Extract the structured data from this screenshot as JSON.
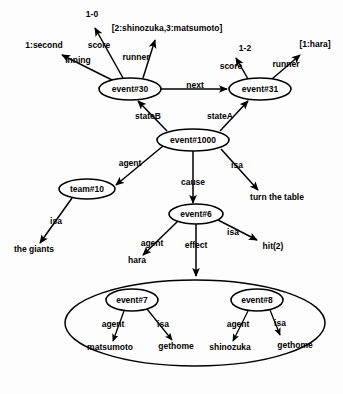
{
  "diagram": {
    "background_color": "#fdfdfd",
    "line_color": "#000000",
    "nodes": [
      {
        "id": "event30",
        "label": "event#30",
        "cx": 130,
        "cy": 89,
        "rx": 31,
        "ry": 11
      },
      {
        "id": "event31",
        "label": "event#31",
        "cx": 260,
        "cy": 89,
        "rx": 31,
        "ry": 11
      },
      {
        "id": "event1000",
        "label": "event#1000",
        "cx": 193,
        "cy": 140,
        "rx": 36,
        "ry": 11
      },
      {
        "id": "team10",
        "label": "team#10",
        "cx": 87,
        "cy": 189,
        "rx": 28,
        "ry": 10
      },
      {
        "id": "event6",
        "label": "event#6",
        "cx": 196,
        "cy": 214,
        "rx": 27,
        "ry": 10
      },
      {
        "id": "event7",
        "label": "event#7",
        "cx": 132,
        "cy": 300,
        "rx": 26,
        "ry": 11
      },
      {
        "id": "event8",
        "label": "event#8",
        "cx": 257,
        "cy": 300,
        "rx": 26,
        "ry": 11
      }
    ],
    "group_ellipse": {
      "cx": 195,
      "cy": 323,
      "rx": 130,
      "ry": 43
    },
    "values": [
      {
        "id": "v-1-second",
        "text": "1:second",
        "x": 44,
        "y": 48
      },
      {
        "id": "v-1-0",
        "text": "1-0",
        "x": 92,
        "y": 17
      },
      {
        "id": "v-runner-30",
        "text": "[2:shinozuka,3:matsumoto]",
        "x": 167,
        "y": 31
      },
      {
        "id": "v-1-2",
        "text": "1-2",
        "x": 245,
        "y": 51
      },
      {
        "id": "v-1-hara",
        "text": "[1:hara]",
        "x": 315,
        "y": 47
      },
      {
        "id": "v-turn-table",
        "text": "turn the table",
        "x": 277,
        "y": 200
      },
      {
        "id": "v-the-giants",
        "text": "the giants",
        "x": 34,
        "y": 252
      },
      {
        "id": "v-hara",
        "text": "hara",
        "x": 137,
        "y": 263
      },
      {
        "id": "v-hit2",
        "text": "hit(2)",
        "x": 273,
        "y": 249
      },
      {
        "id": "v-matsumoto",
        "text": "matsumoto",
        "x": 110,
        "y": 350
      },
      {
        "id": "v-gethome-1",
        "text": "gethome",
        "x": 176,
        "y": 349
      },
      {
        "id": "v-shinozuka",
        "text": "shinozuka",
        "x": 230,
        "y": 350
      },
      {
        "id": "v-gethome-2",
        "text": "gethome",
        "x": 295,
        "y": 348
      }
    ],
    "edge_labels": [
      {
        "id": "el-inning",
        "text": "inning",
        "x": 78,
        "y": 63
      },
      {
        "id": "el-score-30",
        "text": "score",
        "x": 99,
        "y": 48
      },
      {
        "id": "el-runner-30",
        "text": "runner",
        "x": 136,
        "y": 60
      },
      {
        "id": "el-score-31",
        "text": "score",
        "x": 231,
        "y": 69
      },
      {
        "id": "el-runner-31",
        "text": "runner",
        "x": 286,
        "y": 67
      },
      {
        "id": "el-next",
        "text": "next",
        "x": 195,
        "y": 88
      },
      {
        "id": "el-stateB",
        "text": "stateB",
        "x": 148,
        "y": 119
      },
      {
        "id": "el-stateA",
        "text": "stateA",
        "x": 220,
        "y": 119
      },
      {
        "id": "el-agent-1000",
        "text": "agent",
        "x": 130,
        "y": 166
      },
      {
        "id": "el-cause",
        "text": "cause",
        "x": 193,
        "y": 185
      },
      {
        "id": "el-isa-1000",
        "text": "isa",
        "x": 237,
        "y": 168
      },
      {
        "id": "el-isa-team",
        "text": "isa",
        "x": 56,
        "y": 224
      },
      {
        "id": "el-agent-6",
        "text": "agent",
        "x": 152,
        "y": 246
      },
      {
        "id": "el-effect",
        "text": "effect",
        "x": 196,
        "y": 248
      },
      {
        "id": "el-isa-6",
        "text": "isa",
        "x": 233,
        "y": 235
      },
      {
        "id": "el-agent-7",
        "text": "agent",
        "x": 113,
        "y": 327
      },
      {
        "id": "el-isa-7",
        "text": "isa",
        "x": 163,
        "y": 327
      },
      {
        "id": "el-agent-8",
        "text": "agent",
        "x": 238,
        "y": 327
      },
      {
        "id": "el-isa-8",
        "text": "isa",
        "x": 280,
        "y": 326
      }
    ],
    "edges": [
      {
        "id": "e-30-inning",
        "from": "event#30",
        "to": "1:second",
        "label": "inning",
        "arrow": true
      },
      {
        "id": "e-30-score",
        "from": "event#30",
        "to": "1-0",
        "label": "score",
        "arrow": true
      },
      {
        "id": "e-30-runner",
        "from": "event#30",
        "to": "[2:shinozuka,3:matsumoto]",
        "label": "runner",
        "arrow": true
      },
      {
        "id": "e-30-next-31",
        "from": "event#30",
        "to": "event#31",
        "label": "next",
        "arrow": true
      },
      {
        "id": "e-31-score",
        "from": "event#31",
        "to": "1-2",
        "label": "score",
        "arrow": true
      },
      {
        "id": "e-31-runner",
        "from": "event#31",
        "to": "[1:hara]",
        "label": "runner",
        "arrow": true
      },
      {
        "id": "e-1000-stateB",
        "from": "event#1000",
        "to": "event#30",
        "label": "stateB",
        "arrow": true
      },
      {
        "id": "e-1000-stateA",
        "from": "event#1000",
        "to": "event#31",
        "label": "stateA",
        "arrow": true
      },
      {
        "id": "e-1000-agent",
        "from": "event#1000",
        "to": "team#10",
        "label": "agent",
        "arrow": true
      },
      {
        "id": "e-1000-cause",
        "from": "event#1000",
        "to": "event#6",
        "label": "cause",
        "arrow": true
      },
      {
        "id": "e-1000-isa",
        "from": "event#1000",
        "to": "turn the table",
        "label": "isa",
        "arrow": true
      },
      {
        "id": "e-team10-isa",
        "from": "team#10",
        "to": "the giants",
        "label": "isa",
        "arrow": true
      },
      {
        "id": "e-6-agent",
        "from": "event#6",
        "to": "hara",
        "label": "agent",
        "arrow": true
      },
      {
        "id": "e-6-isa",
        "from": "event#6",
        "to": "hit(2)",
        "label": "isa",
        "arrow": true
      },
      {
        "id": "e-6-effect",
        "from": "event#6",
        "to": "group",
        "label": "effect",
        "arrow": true
      },
      {
        "id": "e-7-agent",
        "from": "event#7",
        "to": "matsumoto",
        "label": "agent",
        "arrow": true
      },
      {
        "id": "e-7-isa",
        "from": "event#7",
        "to": "gethome",
        "label": "isa",
        "arrow": true
      },
      {
        "id": "e-8-agent",
        "from": "event#8",
        "to": "shinozuka",
        "label": "agent",
        "arrow": true
      },
      {
        "id": "e-8-isa",
        "from": "event#8",
        "to": "gethome",
        "label": "isa",
        "arrow": true
      }
    ]
  }
}
